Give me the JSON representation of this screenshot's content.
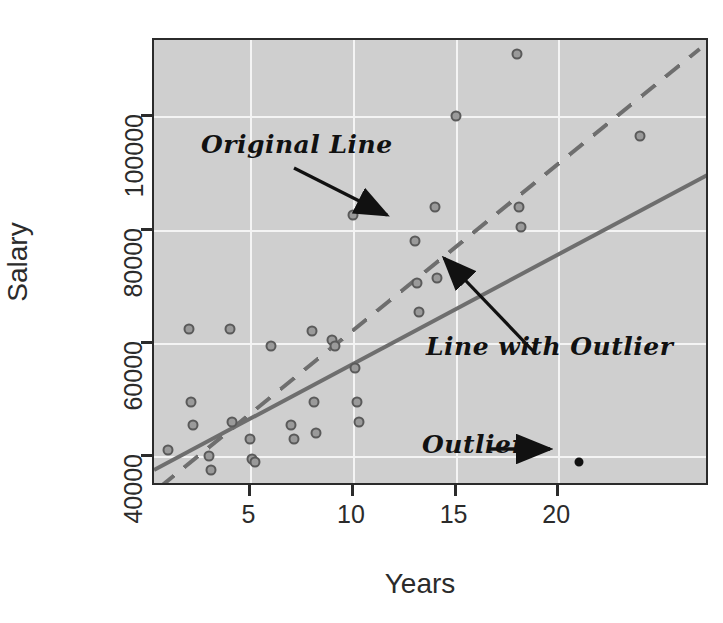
{
  "chart_data": {
    "type": "scatter",
    "title": "",
    "xlabel": "Years",
    "ylabel": "Salary",
    "xlim": [
      0.3,
      27.4
    ],
    "ylim": [
      34500,
      113500
    ],
    "xticks": [
      5,
      10,
      15,
      20
    ],
    "yticks": [
      40000,
      60000,
      80000,
      100000
    ],
    "xticklabels": [
      "5",
      "10",
      "15",
      "20"
    ],
    "yticklabels": [
      "40000",
      "60000",
      "80000",
      "100000"
    ],
    "grid": true,
    "grid_color": "#f4f4f4",
    "panel_background": "#cfcfcf",
    "legend": "none",
    "point_color": "#9a9a9a",
    "point_edge_color": "#5a5a5a",
    "outlier_color": "#111111",
    "line_color": "#6e6e6e",
    "points": [
      {
        "x": 1.0,
        "y": 41000
      },
      {
        "x": 2.0,
        "y": 62500
      },
      {
        "x": 2.1,
        "y": 49500
      },
      {
        "x": 2.2,
        "y": 45500
      },
      {
        "x": 3.0,
        "y": 40000
      },
      {
        "x": 3.1,
        "y": 37500
      },
      {
        "x": 4.0,
        "y": 62500
      },
      {
        "x": 4.1,
        "y": 46000
      },
      {
        "x": 5.0,
        "y": 43000
      },
      {
        "x": 5.1,
        "y": 39500
      },
      {
        "x": 5.2,
        "y": 39000
      },
      {
        "x": 6.0,
        "y": 59500
      },
      {
        "x": 7.0,
        "y": 45500
      },
      {
        "x": 7.1,
        "y": 43000
      },
      {
        "x": 8.0,
        "y": 62000
      },
      {
        "x": 8.1,
        "y": 49500
      },
      {
        "x": 8.2,
        "y": 44000
      },
      {
        "x": 9.0,
        "y": 60500
      },
      {
        "x": 9.1,
        "y": 59500
      },
      {
        "x": 10.0,
        "y": 82500
      },
      {
        "x": 10.1,
        "y": 55500
      },
      {
        "x": 10.2,
        "y": 49500
      },
      {
        "x": 10.3,
        "y": 46000
      },
      {
        "x": 13.0,
        "y": 78000
      },
      {
        "x": 13.1,
        "y": 70500
      },
      {
        "x": 13.2,
        "y": 65500
      },
      {
        "x": 14.0,
        "y": 84000
      },
      {
        "x": 14.1,
        "y": 71500
      },
      {
        "x": 15.0,
        "y": 100000
      },
      {
        "x": 18.0,
        "y": 111000
      },
      {
        "x": 18.1,
        "y": 84000
      },
      {
        "x": 18.2,
        "y": 80500
      },
      {
        "x": 24.0,
        "y": 96500
      }
    ],
    "outlier_point": {
      "x": 21.0,
      "y": 39000,
      "label": "Outlier"
    },
    "lines": [
      {
        "name": "Original Line",
        "style": "dashed",
        "x0": 0.6,
        "y0": 34800,
        "x1": 26.9,
        "y1": 112200
      },
      {
        "name": "Line with Outlier",
        "style": "solid",
        "x0": 0.3,
        "y0": 37800,
        "x1": 27.4,
        "y1": 90200
      }
    ],
    "annotations": [
      {
        "name": "Original Line",
        "text": "Original Line"
      },
      {
        "name": "Line with Outlier",
        "text": "Line with Outlier"
      },
      {
        "name": "Outlier",
        "text": "Outlier"
      }
    ]
  }
}
